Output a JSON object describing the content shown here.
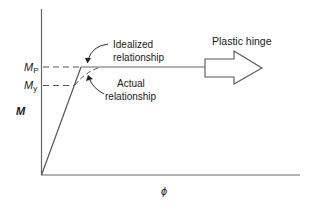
{
  "diagram": {
    "type": "moment-curvature",
    "y_axis_label": "M",
    "x_axis_label": "ϕ",
    "y_ticks": [
      {
        "main": "M",
        "sub": "P",
        "y": 66
      },
      {
        "main": "M",
        "sub": "y",
        "y": 85
      }
    ],
    "annotations": {
      "idealized": {
        "line1": "Idealized",
        "line2": "relationship"
      },
      "actual": {
        "line1": "Actual",
        "line2": "relationship"
      },
      "plastic_hinge": "Plastic hinge"
    },
    "colors": {
      "line": "#555555",
      "text": "#1a1a1a",
      "background": "#ffffff"
    }
  }
}
